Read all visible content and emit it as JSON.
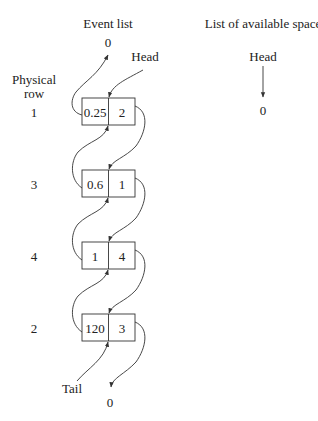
{
  "event_list": {
    "title": "Event list",
    "head_label": "Head",
    "tail_label": "Tail",
    "top_null": "0",
    "bottom_null": "0",
    "row_axis_label_line1": "Physical",
    "row_axis_label_line2": "row",
    "nodes": [
      {
        "physical_row": "1",
        "value": "0.25",
        "pointer": "2"
      },
      {
        "physical_row": "3",
        "value": "0.6",
        "pointer": "1"
      },
      {
        "physical_row": "4",
        "value": "1",
        "pointer": "4"
      },
      {
        "physical_row": "2",
        "value": "120",
        "pointer": "3"
      }
    ]
  },
  "available_space": {
    "title": "List of available space",
    "head_label": "Head",
    "null_value": "0"
  },
  "colors": {
    "line": "#333333",
    "text": "#222222",
    "background": "#ffffff"
  }
}
